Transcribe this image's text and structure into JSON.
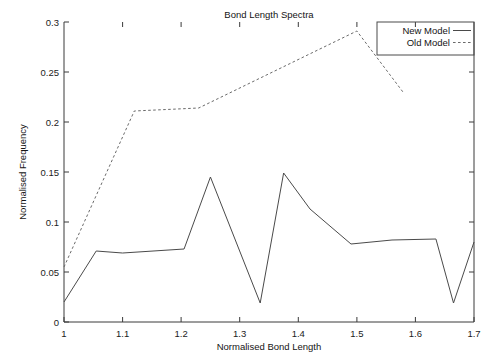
{
  "chart_data": {
    "type": "line",
    "title": "Bond Length Spectra",
    "xlabel": "Normalised Bond Length",
    "ylabel": "Normalised Frequency",
    "xlim": [
      1.0,
      1.7
    ],
    "ylim": [
      0,
      0.3
    ],
    "xticks": [
      1,
      1.1,
      1.2,
      1.3,
      1.4,
      1.5,
      1.6,
      1.7
    ],
    "xtick_labels": [
      "1",
      "1.1",
      "1.2",
      "1.3",
      "1.4",
      "1.5",
      "1.6",
      "1.7"
    ],
    "yticks": [
      0,
      0.05,
      0.1,
      0.15,
      0.2,
      0.25,
      0.3
    ],
    "ytick_labels": [
      "0",
      "0.05",
      "0.1",
      "0.15",
      "0.2",
      "0.25",
      "0.3"
    ],
    "grid": false,
    "legend_position": "top-right",
    "series": [
      {
        "name": "New Model",
        "style": "solid",
        "color": "#4a4a4a",
        "x": [
          1.0,
          1.055,
          1.1,
          1.205,
          1.25,
          1.335,
          1.375,
          1.42,
          1.49,
          1.56,
          1.635,
          1.665,
          1.7
        ],
        "y": [
          0.02,
          0.071,
          0.069,
          0.073,
          0.145,
          0.019,
          0.149,
          0.113,
          0.078,
          0.082,
          0.083,
          0.019,
          0.08
        ]
      },
      {
        "name": "Old Model",
        "style": "dashed",
        "color": "#6a6a6a",
        "x": [
          1.0,
          1.12,
          1.23,
          1.5,
          1.58
        ],
        "y": [
          0.055,
          0.211,
          0.214,
          0.291,
          0.229
        ]
      }
    ]
  },
  "legend": {
    "entries": [
      {
        "label": "New Model",
        "style": "solid"
      },
      {
        "label": "Old Model",
        "style": "dashed"
      }
    ]
  }
}
